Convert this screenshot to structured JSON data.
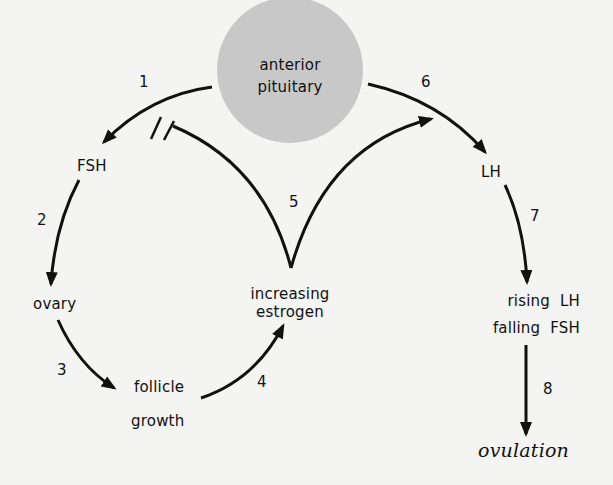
{
  "diagram": {
    "title": "",
    "colors": {
      "background": "#f4f4f2",
      "pituitary_fill": "#c8c8c8",
      "stroke": "#111111"
    },
    "nodes": {
      "pituitary_line1": "anterior",
      "pituitary_line2": "pituitary",
      "fsh": "FSH",
      "ovary": "ovary",
      "follicle_line1": "follicle",
      "follicle_line2": "growth",
      "estrogen_line1": "increasing",
      "estrogen_line2": "estrogen",
      "lh": "LH",
      "rising_lh": "rising  LH",
      "falling_fsh": "falling  FSH",
      "ovulation": "ovulation"
    },
    "steps": {
      "s1": "1",
      "s2": "2",
      "s3": "3",
      "s4": "4",
      "s5": "5",
      "s6": "6",
      "s7": "7",
      "s8": "8"
    },
    "edges": [
      {
        "step": "1",
        "from": "anterior pituitary",
        "to": "FSH",
        "type": "stimulates"
      },
      {
        "step": "2",
        "from": "FSH",
        "to": "ovary",
        "type": "stimulates"
      },
      {
        "step": "3",
        "from": "ovary",
        "to": "follicle growth",
        "type": "stimulates"
      },
      {
        "step": "4",
        "from": "follicle growth",
        "to": "increasing estrogen",
        "type": "stimulates"
      },
      {
        "step": "5",
        "from": "increasing estrogen",
        "to": "anterior pituitary (FSH release)",
        "type": "inhibits"
      },
      {
        "step": "5",
        "from": "increasing estrogen",
        "to": "anterior pituitary (LH release)",
        "type": "stimulates"
      },
      {
        "step": "6",
        "from": "anterior pituitary",
        "to": "LH",
        "type": "stimulates"
      },
      {
        "step": "7",
        "from": "LH",
        "to": "rising LH / falling FSH",
        "type": "leads to"
      },
      {
        "step": "8",
        "from": "rising LH / falling FSH",
        "to": "ovulation",
        "type": "leads to"
      }
    ]
  }
}
